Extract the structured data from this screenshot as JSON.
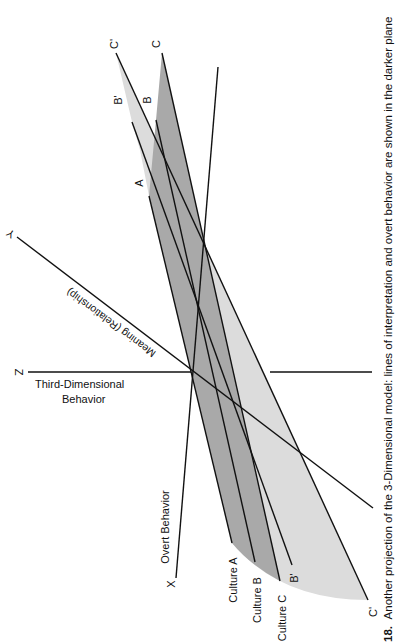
{
  "figure": {
    "caption_number": "18.",
    "caption_text": "Another projection of the 3-Dimensional model: lines of interpretation and overt behavior are shown in the darker plane",
    "colors": {
      "background": "#ffffff",
      "line": "#111111",
      "light_plane": "#dcdcdc",
      "dark_plane": "#a9a9a9"
    }
  },
  "axes": {
    "z": {
      "letter": "Z",
      "label_line1": "Third-Dimensional",
      "label_line2": "Behavior"
    },
    "y": {
      "letter": "Y",
      "label": "Meaning (Relationship)"
    },
    "x": {
      "letter": "X",
      "label": "Overt Behavior"
    }
  },
  "line_labels": {
    "top": {
      "c_prime": "C'",
      "c": "C",
      "b_prime": "B'",
      "b": "B",
      "a": "A"
    },
    "bottom": {
      "culture_a": "Culture A",
      "culture_b": "Culture B",
      "culture_c": "Culture C",
      "b_prime": "B'",
      "c_prime": "C'"
    }
  }
}
